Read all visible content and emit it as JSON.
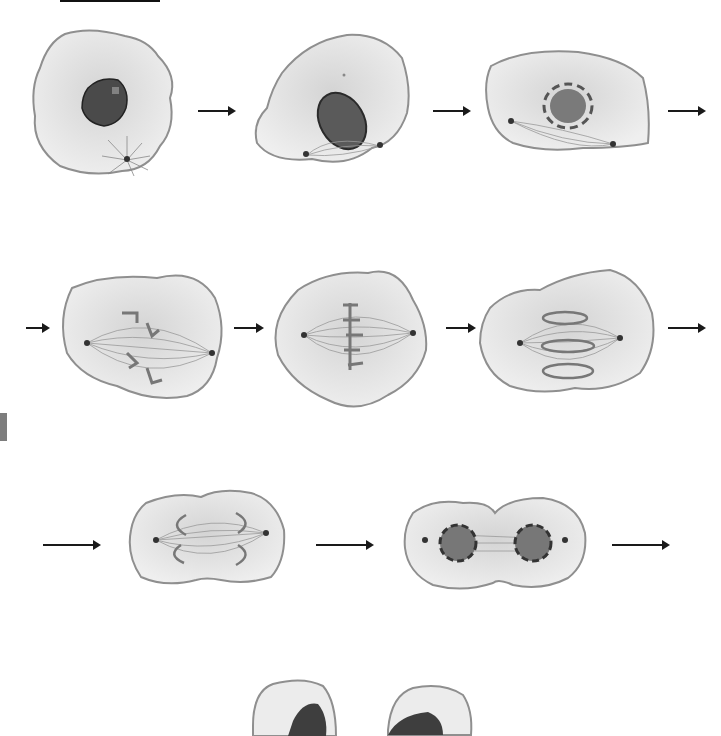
{
  "diagram": {
    "colors": {
      "cell_fill": "#e9e9e9",
      "cell_outline": "#8f8f8f",
      "nucleus_fill": "#4a4a4a",
      "chromosome": "#7a7a7a",
      "spindle": "#9a9a9a",
      "arrow": "#1a1a1a"
    },
    "rows": [
      {
        "row": 1,
        "stages": [
          {
            "id": "interphase",
            "description": "Interphase cell with dark nucleus and centrosome"
          },
          {
            "id": "early-prophase",
            "description": "Nucleus with condensing chromosomes, centrosomes moving apart with spindle"
          },
          {
            "id": "prometaphase",
            "description": "Nuclear envelope fragmenting, chromosomes condensed"
          }
        ],
        "arrows": 3
      },
      {
        "row": 2,
        "stages": [
          {
            "id": "prometaphase-late",
            "description": "Chromosomes attaching to spindle fibers"
          },
          {
            "id": "metaphase",
            "description": "Chromosomes aligned at metaphase plate"
          },
          {
            "id": "anaphase",
            "description": "Sister chromatids pulled to opposite poles"
          }
        ],
        "arrows": 3
      },
      {
        "row": 3,
        "stages": [
          {
            "id": "late-anaphase",
            "description": "Cell elongating, chromatids at poles, cleavage beginning"
          },
          {
            "id": "telophase",
            "description": "Two nuclei re-forming, cleavage furrow"
          }
        ],
        "arrows": 3
      },
      {
        "row": 4,
        "stages": [
          {
            "id": "daughter-cells",
            "description": "Two daughter cells in interphase (partially cropped)"
          }
        ],
        "arrows": 0
      }
    ]
  }
}
